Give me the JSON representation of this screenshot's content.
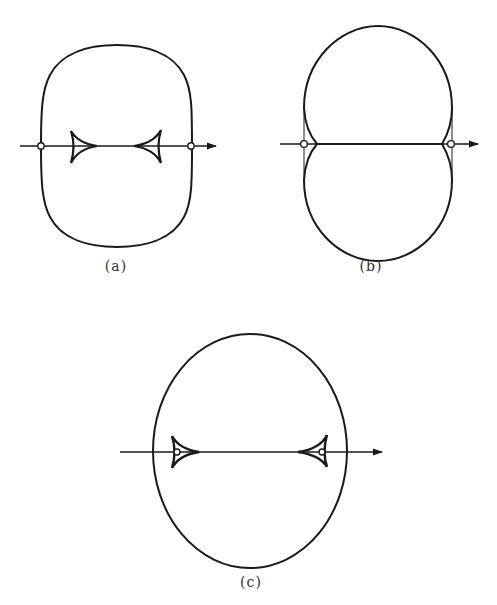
{
  "figures": [
    {
      "id": "a",
      "label": "(a)",
      "description": "Rounded oval outer curve; horizontal axis with arrow; two small open circles at axis/curve intersections; two inward-pointing cusped triangles (deltoid caustics) on axis"
    },
    {
      "id": "b",
      "label": "(b)",
      "description": "Two-lobed peanut-shaped outer curve pinched at axis; horizontal axis with arrow; open circles at both pinch points with thin cusps"
    },
    {
      "id": "c",
      "label": "(c)",
      "description": "Ellipse outer curve; horizontal axis with arrow; two cusped triangles (caustics) on axis each containing a small open circle"
    }
  ],
  "colors": {
    "stroke": "#1a1a1a",
    "background": "#ffffff"
  }
}
